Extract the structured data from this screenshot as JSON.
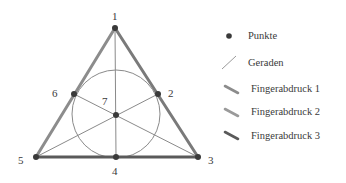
{
  "diagram": {
    "type": "fano-plane",
    "points": [
      {
        "id": "1",
        "label": "1",
        "x": 115,
        "y": 28,
        "lx": 112,
        "ly": 20
      },
      {
        "id": "2",
        "label": "2",
        "x": 158,
        "y": 94,
        "lx": 168,
        "ly": 97
      },
      {
        "id": "3",
        "label": "3",
        "x": 198,
        "y": 157,
        "lx": 208,
        "ly": 164
      },
      {
        "id": "4",
        "label": "4",
        "x": 116,
        "y": 157,
        "lx": 112,
        "ly": 174
      },
      {
        "id": "5",
        "label": "5",
        "x": 36,
        "y": 157,
        "lx": 18,
        "ly": 164
      },
      {
        "id": "6",
        "label": "6",
        "x": 74,
        "y": 94,
        "lx": 52,
        "ly": 97
      },
      {
        "id": "7",
        "label": "7",
        "x": 116,
        "y": 115,
        "lx": 102,
        "ly": 105
      }
    ],
    "circle": {
      "cx": 116,
      "cy": 114,
      "r": 44
    },
    "colors": {
      "points": "#3a3a3a",
      "lines": "#8a8a8a",
      "fingerprint1": "#8c8c8c",
      "fingerprint2": "#9a9a9a",
      "fingerprint3": "#5a5a5a"
    }
  },
  "legend": {
    "items": [
      {
        "key": "points",
        "label": "Punkte"
      },
      {
        "key": "lines",
        "label": "Geraden"
      },
      {
        "key": "fingerprint1",
        "label": "Fingerabdruck 1"
      },
      {
        "key": "fingerprint2",
        "label": "Fingerabdruck 2"
      },
      {
        "key": "fingerprint3",
        "label": "Fingerabdruck 3"
      }
    ]
  }
}
